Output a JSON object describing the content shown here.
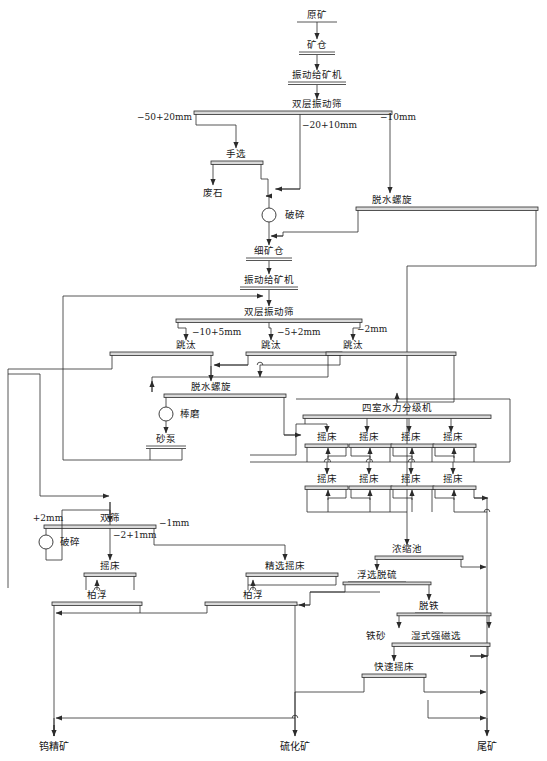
{
  "diagram": {
    "title_units": {
      "raw_ore": "原矿",
      "ore_bin": "矿仓",
      "vibrating_feeder_1": "振动给矿机",
      "double_deck_screen_1": "双层振动筛",
      "hand_sorting": "手选",
      "waste_rock": "废石",
      "crushing_1": "破碎",
      "dewatering_spiral_1": "脱水螺旋",
      "fine_ore_bin": "细矿仓",
      "vibrating_feeder_2": "振动给矿机",
      "double_deck_screen_2": "双层振动筛",
      "jig_1": "跳汰",
      "jig_2": "跳汰",
      "jig_3": "跳汰",
      "dewatering_spiral_2": "脱水螺旋",
      "rod_mill": "棒磨",
      "sand_pump": "砂泵",
      "four_chamber_classifier": "四室水力分级机",
      "shaking_table": "摇床",
      "double_screen": "双筛",
      "crushing_2": "破碎",
      "cleaning_shaking_table": "精选摇床",
      "flotation": "柏浮",
      "thickener": "浓缩池",
      "flotation_desulfurization": "浮选脱硫",
      "iron_removal": "脱铁",
      "iron_sand": "铁砂",
      "wet_high_intensity_magnetic": "湿式强磁选",
      "fast_shaking_table": "快速摇床"
    },
    "size_labels": {
      "s1": "−50+20mm",
      "s2": "−20+10mm",
      "s3": "−10mm",
      "s4": "−10+5mm",
      "s5": "−5+2mm",
      "s6": "−2mm",
      "s7": "+2mm",
      "s8": "−2+1mm",
      "s9": "−1mm"
    },
    "products": {
      "tungsten_concentrate": "钨精矿",
      "sulfide_ore": "硫化矿",
      "tailings": "尾矿"
    },
    "colors": {
      "line": "#2b2b2b",
      "unit_fill": "#d9d9d9",
      "background": "#ffffff"
    }
  }
}
